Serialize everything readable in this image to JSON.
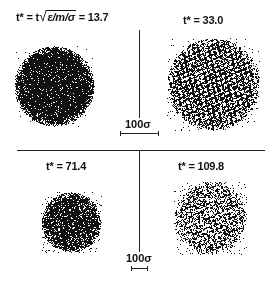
{
  "figure": {
    "panels": [
      {
        "id": "top-left",
        "label_prefix": "t* = t",
        "label_radicand": "ε/m/σ",
        "label_suffix": "= 13.7",
        "time": 13.7,
        "cluster": {
          "cx": 54,
          "cy": 86,
          "r": 40,
          "density": 0.95,
          "holes": 0.04,
          "halo": 0.15
        }
      },
      {
        "id": "top-right",
        "label": "t* = 33.0",
        "time": 33.0,
        "cluster": {
          "cx": 213,
          "cy": 84,
          "r": 46,
          "density": 0.8,
          "holes": 0.35,
          "halo": 0.35
        }
      },
      {
        "id": "bottom-left",
        "label": "t* = 71.4",
        "time": 71.4,
        "cluster": {
          "cx": 71,
          "cy": 222,
          "r": 30,
          "density": 0.9,
          "holes": 0.1,
          "halo": 0.6
        }
      },
      {
        "id": "bottom-right",
        "label": "t* = 109.8",
        "time": 109.8,
        "cluster": {
          "cx": 210,
          "cy": 218,
          "r": 36,
          "density": 0.6,
          "holes": 0.35,
          "halo": 0.7
        }
      }
    ],
    "scale_bars": [
      {
        "id": "scale-top",
        "label": "100σ"
      },
      {
        "id": "scale-bottom",
        "label": "100σ"
      }
    ],
    "colors": {
      "ink": "#111111",
      "background": "#ffffff"
    }
  }
}
